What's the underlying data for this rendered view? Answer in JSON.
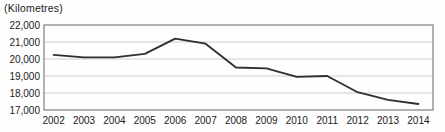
{
  "title": "(Kilometres)",
  "colors": {
    "background": "#fefefe",
    "line": "#2e2e2e",
    "border": "#7d7d7d",
    "grid": "#cccccc",
    "text": "#1a1a1a"
  },
  "chart_data": {
    "type": "line",
    "title": "(Kilometres)",
    "xlabel": "",
    "ylabel": "Kilometres",
    "x": [
      2002,
      2003,
      2004,
      2005,
      2006,
      2007,
      2008,
      2009,
      2010,
      2011,
      2012,
      2013,
      2014
    ],
    "values": [
      20250,
      20100,
      20100,
      20300,
      21200,
      20900,
      19500,
      19450,
      18950,
      19000,
      18050,
      17600,
      17350
    ],
    "ylim": [
      17000,
      22000
    ],
    "ytick_interval": 1000,
    "ytick_labels": [
      "22,000",
      "21,000",
      "20,000",
      "19,000",
      "18,000",
      "17,000"
    ],
    "xtick_labels": [
      "2002",
      "2003",
      "2004",
      "2005",
      "2006",
      "2007",
      "2008",
      "2009",
      "2010",
      "2011",
      "2012",
      "2013",
      "2014"
    ],
    "grid": true,
    "legend": false,
    "legend_position": "none"
  }
}
